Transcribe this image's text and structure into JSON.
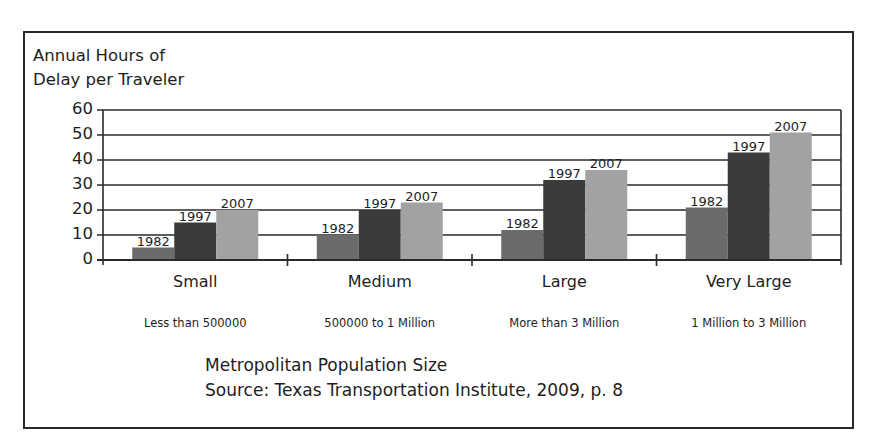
{
  "chart_data": {
    "type": "bar",
    "title": "Annual Hours of Delay per Traveler",
    "ylabel_lines": [
      "Annual Hours of",
      "Delay per Traveler"
    ],
    "xlabel": "Metropolitan Population Size",
    "source": "Source: Texas Transportation Institute, 2009, p. 8",
    "categories": [
      "Small",
      "Medium",
      "Large",
      "Very Large"
    ],
    "category_subtitles": [
      "Less than 500000",
      "500000 to 1 Million",
      "More than 3 Million",
      "1 Million to 3 Million"
    ],
    "series": [
      {
        "name": "1982",
        "color": "#6b6b6b",
        "values": [
          5,
          10,
          12,
          21
        ]
      },
      {
        "name": "1997",
        "color": "#3b3b3b",
        "values": [
          15,
          20,
          32,
          43
        ]
      },
      {
        "name": "2007",
        "color": "#a2a2a2",
        "values": [
          20,
          23,
          36,
          51
        ]
      }
    ],
    "ylim": [
      0,
      60
    ],
    "yticks": [
      "0",
      "10",
      "20",
      "30",
      "40",
      "50",
      "60"
    ],
    "grid": true,
    "legend": "none (series labeled above each bar)"
  }
}
